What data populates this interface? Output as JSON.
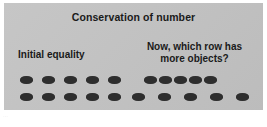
{
  "figure": {
    "title": "Conservation of number",
    "background_color": "#c3c3c3",
    "dot_color": "#2e2e2e",
    "text_color": "#1a1a1a"
  },
  "left_panel": {
    "label": "Initial equality",
    "rows": [
      {
        "name": "left-top-row",
        "count": 5,
        "spacing": "even",
        "x_positions": [
          0,
          22,
          44,
          66,
          88
        ]
      },
      {
        "name": "left-bottom-row",
        "count": 5,
        "spacing": "even",
        "x_positions": [
          0,
          22,
          44,
          66,
          88
        ]
      }
    ]
  },
  "right_panel": {
    "label_line1": "Now, which row has",
    "label_line2": "more objects?",
    "rows": [
      {
        "name": "right-top-row",
        "count": 5,
        "spacing": "compact",
        "x_positions": [
          0,
          15,
          30,
          45,
          60
        ]
      },
      {
        "name": "right-bottom-row",
        "count": 5,
        "spacing": "spread",
        "x_positions": [
          0,
          26,
          52,
          78,
          104
        ]
      }
    ]
  },
  "caption": {
    "text": "..."
  },
  "chart_data": {
    "type": "diagram",
    "title": "Conservation of number",
    "groups": [
      {
        "label": "Initial equality",
        "rows": [
          {
            "objects": 5,
            "layout": "aligned"
          },
          {
            "objects": 5,
            "layout": "aligned"
          }
        ]
      },
      {
        "label": "Now, which row has more objects?",
        "rows": [
          {
            "objects": 5,
            "layout": "compact"
          },
          {
            "objects": 5,
            "layout": "spread"
          }
        ]
      }
    ]
  }
}
